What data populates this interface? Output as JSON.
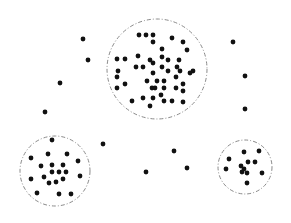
{
  "diagram": {
    "colors": {
      "point": "#111111",
      "boundary": "#8a8a8a",
      "background": "#ffffff"
    },
    "point_radius": 2.4,
    "clusters": [
      {
        "name": "large-top-cluster",
        "boundary": {
          "cx": 157,
          "cy": 69,
          "r": 50
        },
        "points": [
          [
            139,
            35
          ],
          [
            146,
            35
          ],
          [
            153,
            35
          ],
          [
            153,
            42
          ],
          [
            172,
            38
          ],
          [
            183,
            42
          ],
          [
            187,
            50
          ],
          [
            162,
            49
          ],
          [
            117,
            59
          ],
          [
            125,
            59
          ],
          [
            138,
            56
          ],
          [
            150,
            60
          ],
          [
            153,
            63
          ],
          [
            162,
            57
          ],
          [
            168,
            60
          ],
          [
            179,
            60
          ],
          [
            136,
            67
          ],
          [
            143,
            67
          ],
          [
            162,
            67
          ],
          [
            177,
            67
          ],
          [
            180,
            71
          ],
          [
            168,
            71
          ],
          [
            153,
            73
          ],
          [
            193,
            71
          ],
          [
            190,
            73
          ],
          [
            118,
            71
          ],
          [
            117,
            77
          ],
          [
            125,
            84
          ],
          [
            117,
            88
          ],
          [
            147,
            81
          ],
          [
            157,
            81
          ],
          [
            164,
            81
          ],
          [
            176,
            77
          ],
          [
            152,
            88
          ],
          [
            155,
            88
          ],
          [
            164,
            88
          ],
          [
            176,
            88
          ],
          [
            183,
            84
          ],
          [
            183,
            91
          ],
          [
            132,
            101
          ],
          [
            143,
            98
          ],
          [
            153,
            98
          ],
          [
            161,
            95
          ],
          [
            164,
            101
          ],
          [
            172,
            101
          ],
          [
            183,
            102
          ],
          [
            150,
            106
          ]
        ]
      },
      {
        "name": "lower-left-cluster",
        "boundary": {
          "cx": 55,
          "cy": 171,
          "r": 35
        },
        "points": [
          [
            52,
            140
          ],
          [
            31,
            158
          ],
          [
            48,
            154
          ],
          [
            67,
            154
          ],
          [
            78,
            161
          ],
          [
            41,
            166
          ],
          [
            52,
            165
          ],
          [
            63,
            165
          ],
          [
            52,
            172
          ],
          [
            59,
            172
          ],
          [
            66,
            172
          ],
          [
            44,
            177
          ],
          [
            80,
            176
          ],
          [
            31,
            179
          ],
          [
            49,
            183
          ],
          [
            56,
            182
          ],
          [
            63,
            179
          ],
          [
            37,
            193
          ],
          [
            59,
            194
          ],
          [
            71,
            194
          ]
        ]
      },
      {
        "name": "lower-right-cluster",
        "boundary": {
          "cx": 245,
          "cy": 167,
          "r": 27
        },
        "points": [
          [
            244,
            152
          ],
          [
            259,
            151
          ],
          [
            229,
            159
          ],
          [
            248,
            162
          ],
          [
            255,
            162
          ],
          [
            226,
            169
          ],
          [
            241,
            166
          ],
          [
            244,
            169
          ],
          [
            242,
            172
          ],
          [
            247,
            173
          ],
          [
            262,
            173
          ],
          [
            247,
            183
          ]
        ]
      }
    ],
    "noise_points": [
      [
        83,
        39
      ],
      [
        88,
        60
      ],
      [
        60,
        83
      ],
      [
        45,
        112
      ],
      [
        233,
        42
      ],
      [
        245,
        76
      ],
      [
        245,
        109
      ],
      [
        103,
        144
      ],
      [
        146,
        172
      ],
      [
        174,
        151
      ],
      [
        187,
        168
      ]
    ]
  }
}
